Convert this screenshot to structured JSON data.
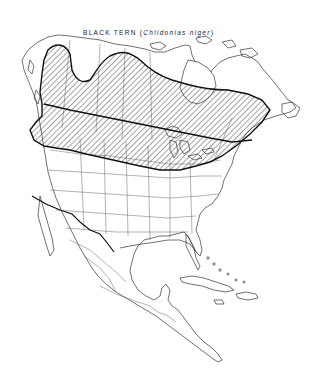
{
  "map": {
    "title_common": "BLACK TERN",
    "title_scientific_open": "(",
    "title_scientific": "Chlidonias niger",
    "title_scientific_close": ")",
    "region": "North America",
    "legend": {
      "hatched_area": "breeding range"
    },
    "colors": {
      "background": "#ffffff",
      "lines": "#222222",
      "hatch": "#333333"
    }
  }
}
